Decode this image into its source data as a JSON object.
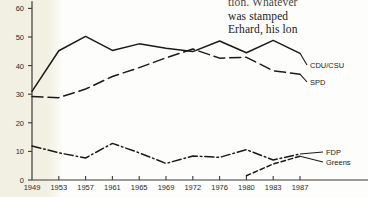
{
  "book_text": {
    "lines": [
      "tion. Whatever",
      "was  stamped",
      "Erhard,  his lon"
    ]
  },
  "chart_data": {
    "type": "line",
    "title": "",
    "xlabel": "",
    "ylabel": "",
    "ylim": [
      0,
      60
    ],
    "yticks": [
      0,
      10,
      20,
      30,
      40,
      50,
      60
    ],
    "ytick_labels": [
      "0",
      "10",
      "20",
      "30",
      "40",
      "50",
      "60"
    ],
    "grid": false,
    "legend_position": "right-inline",
    "x": [
      1949,
      1953,
      1957,
      1961,
      1965,
      1969,
      1972,
      1976,
      1980,
      1983,
      1987
    ],
    "xtick_labels": [
      "1949",
      "1953",
      "1957",
      "1961",
      "1965",
      "1969",
      "1972",
      "1976",
      "1980",
      "1983",
      "1987"
    ],
    "series": [
      {
        "name": "CDU/CSU",
        "style": "solid",
        "color": "#1a1a1a",
        "values": [
          31.0,
          45.2,
          50.2,
          45.3,
          47.6,
          46.1,
          44.9,
          48.6,
          44.5,
          48.8,
          44.3
        ]
      },
      {
        "name": "SPD",
        "style": "long-dash",
        "color": "#1a1a1a",
        "values": [
          29.2,
          28.8,
          31.8,
          36.2,
          39.3,
          42.7,
          45.8,
          42.6,
          42.9,
          38.2,
          37.0
        ]
      },
      {
        "name": "FDP",
        "style": "dash-dot",
        "color": "#1a1a1a",
        "values": [
          11.9,
          9.5,
          7.7,
          12.8,
          9.5,
          5.8,
          8.4,
          7.9,
          10.6,
          7.0,
          9.1
        ]
      },
      {
        "name": "Greens",
        "style": "short-dash",
        "color": "#1a1a1a",
        "values": [
          null,
          null,
          null,
          null,
          null,
          null,
          null,
          null,
          1.5,
          5.6,
          8.3
        ]
      }
    ],
    "series_labels": [
      {
        "name": "CDU/CSU",
        "label": "CDU/CSU"
      },
      {
        "name": "SPD",
        "label": "SPD"
      },
      {
        "name": "FDP",
        "label": "FDP"
      },
      {
        "name": "Greens",
        "label": "Greens"
      }
    ]
  }
}
